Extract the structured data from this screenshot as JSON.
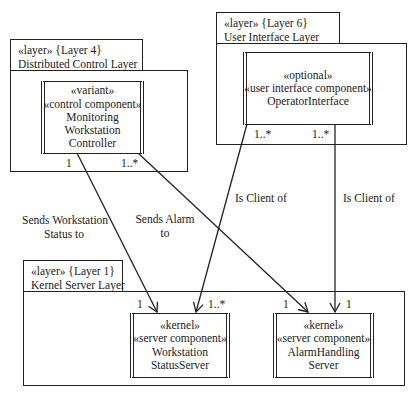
{
  "layers": {
    "layer4": {
      "stereotype_line": "«layer» {Layer 4}",
      "name": "Distributed Control Layer"
    },
    "layer6": {
      "stereotype_line": "«layer» {Layer 6}",
      "name": "User Interface Layer"
    },
    "layer1": {
      "stereotype_line": "«layer» {Layer 1}",
      "name": "Kernel Server Layer"
    }
  },
  "components": {
    "monitoring_controller": {
      "lines": [
        "«variant»",
        "«control component»",
        "Monitoring",
        "Workstation",
        "Controller"
      ]
    },
    "operator_interface": {
      "lines": [
        "«optional»",
        "«user interface component»",
        "OperatorInterface"
      ]
    },
    "workstation_status_server": {
      "lines": [
        "«kernel»",
        "«server component»",
        "Workstation",
        "StatusServer"
      ]
    },
    "alarm_handling_server": {
      "lines": [
        "«kernel»",
        "«server component»",
        "AlarmHandling",
        "Server"
      ]
    }
  },
  "associations": [
    {
      "id": "sends-status",
      "label_lines": [
        "Sends Workstation",
        "Status to"
      ],
      "source_mult": "1",
      "target_mult": "1"
    },
    {
      "id": "sends-alarm",
      "label_lines": [
        "Sends Alarm",
        "to"
      ],
      "source_mult": "1..*",
      "target_mult": "1"
    },
    {
      "id": "client-status",
      "label_lines": [
        "Is Client of"
      ],
      "source_mult": "1..*",
      "target_mult": "1..*"
    },
    {
      "id": "client-alarm",
      "label_lines": [
        "Is Client of"
      ],
      "source_mult": "1..*",
      "target_mult": "1"
    }
  ],
  "colors": {
    "line": "#222222",
    "background": "#ffffff",
    "text": "#1a1a1a"
  }
}
